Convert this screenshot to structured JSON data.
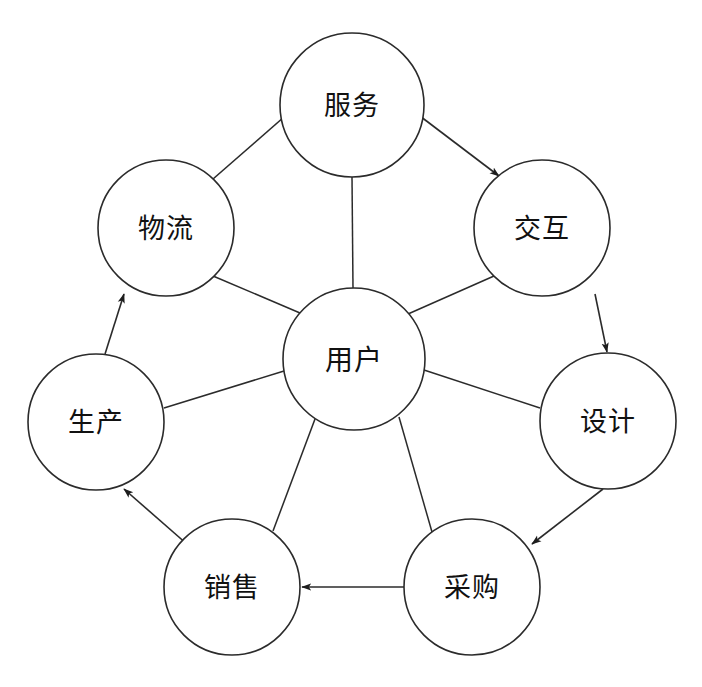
{
  "diagram": {
    "type": "hub-and-spoke-cycle",
    "background_color": "#ffffff",
    "line_color": "#2b2b2b",
    "label_color": "#111111",
    "center_node": {
      "id": "user",
      "label": "用户",
      "cx": 354,
      "cy": 359,
      "r": 71
    },
    "outer_nodes": [
      {
        "id": "service",
        "label": "服务",
        "cx": 352,
        "cy": 105,
        "r": 72
      },
      {
        "id": "interaction",
        "label": "交互",
        "cx": 542,
        "cy": 228,
        "r": 68
      },
      {
        "id": "design",
        "label": "设计",
        "cx": 608,
        "cy": 421,
        "r": 68
      },
      {
        "id": "procurement",
        "label": "采购",
        "cx": 472,
        "cy": 587,
        "r": 68
      },
      {
        "id": "sales",
        "label": "销售",
        "cx": 232,
        "cy": 587,
        "r": 68
      },
      {
        "id": "production",
        "label": "生产",
        "cx": 96,
        "cy": 422,
        "r": 68
      },
      {
        "id": "logistics",
        "label": "物流",
        "cx": 166,
        "cy": 228,
        "r": 68
      }
    ],
    "spokes": [
      {
        "from": "user",
        "to": "service",
        "arrow": false
      },
      {
        "from": "user",
        "to": "interaction",
        "arrow": false
      },
      {
        "from": "user",
        "to": "design",
        "arrow": false
      },
      {
        "from": "user",
        "to": "procurement",
        "arrow": false
      },
      {
        "from": "user",
        "to": "sales",
        "arrow": false
      },
      {
        "from": "user",
        "to": "production",
        "arrow": false
      },
      {
        "from": "user",
        "to": "logistics",
        "arrow": false
      }
    ],
    "cycle_edges": [
      {
        "from": "logistics",
        "to": "service",
        "arrow": true
      },
      {
        "from": "service",
        "to": "interaction",
        "arrow": true
      },
      {
        "from": "interaction",
        "to": "design",
        "arrow": true
      },
      {
        "from": "design",
        "to": "procurement",
        "arrow": true
      },
      {
        "from": "procurement",
        "to": "sales",
        "arrow": true
      },
      {
        "from": "sales",
        "to": "production",
        "arrow": true
      },
      {
        "from": "production",
        "to": "logistics",
        "arrow": true
      }
    ],
    "top_caption": ""
  }
}
